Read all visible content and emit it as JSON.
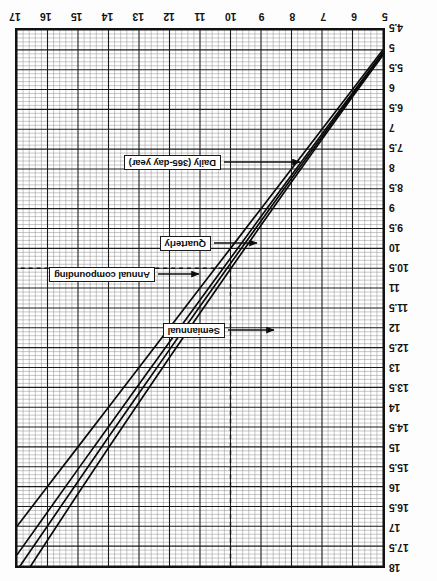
{
  "figure": {
    "orientation": "rotated-180",
    "background": "#ffffff",
    "ink": "#111111"
  },
  "chart_data": {
    "type": "line",
    "title": "",
    "subtitle": "",
    "xlabel": "",
    "ylabel": "",
    "grid": "log-log ruled graph paper, major and minor rulings",
    "legend_position": "inline callouts with leader arrows",
    "xlim": [
      5,
      17
    ],
    "ylim": [
      4.5,
      18
    ],
    "x_ticks": [
      5,
      6,
      7,
      8,
      9,
      10,
      11,
      12,
      13,
      14,
      15,
      16,
      17
    ],
    "x_ticklabels": [
      "5",
      "6",
      "7",
      "8",
      "9",
      "10",
      "11",
      "12",
      "13",
      "14",
      "15",
      "16",
      "17"
    ],
    "y_ticks": [
      4.5,
      5,
      5.5,
      6,
      6.5,
      7,
      7.5,
      8,
      8.5,
      9,
      9.5,
      10,
      10.5,
      11,
      11.5,
      12,
      12.5,
      13,
      13.5,
      14,
      14.5,
      15,
      15.5,
      16,
      16.5,
      17,
      17.5,
      18
    ],
    "y_ticklabels": [
      "4.5",
      "5",
      "5.5",
      "6",
      "6.5",
      "7",
      "7.5",
      "8",
      "8.5",
      "9",
      "9.5",
      "10",
      "10.5",
      "11",
      "11.5",
      "12",
      "12.5",
      "13",
      "13.5",
      "14",
      "14.5",
      "15",
      "15.5",
      "16",
      "16.5",
      "17",
      "17.5",
      "18"
    ],
    "annotations": [
      {
        "text": "10",
        "kind": "vertical-dashed-reference",
        "x": 10
      },
      {
        "text": "10.5",
        "kind": "horizontal-dashed-reference",
        "y": 10.5
      }
    ],
    "series": [
      {
        "name": "Annual compounding",
        "label": "Annual compounding",
        "x": [
          5,
          6,
          7,
          8,
          9,
          10,
          11,
          12,
          13,
          14,
          15,
          16,
          17
        ],
        "values": [
          5,
          6,
          7,
          8,
          9,
          10,
          11,
          12,
          13,
          14,
          15,
          16,
          17
        ]
      },
      {
        "name": "Semiannual",
        "label": "Semiannual",
        "x": [
          5,
          6,
          7,
          8,
          9,
          10,
          11,
          12,
          13,
          14,
          15,
          16,
          17
        ],
        "values": [
          5.06,
          6.09,
          7.12,
          8.16,
          9.2,
          10.25,
          11.3,
          12.36,
          13.42,
          14.49,
          15.56,
          16.64,
          17.72
        ]
      },
      {
        "name": "Quarterly",
        "label": "Quarterly",
        "x": [
          5,
          6,
          7,
          8,
          9,
          10,
          11,
          12,
          13,
          14,
          15,
          16,
          17
        ],
        "values": [
          5.09,
          6.14,
          7.19,
          8.24,
          9.31,
          10.38,
          11.46,
          12.55,
          13.65,
          14.75,
          15.87,
          16.99,
          18.11
        ]
      },
      {
        "name": "Daily (365-day year)",
        "label": "Daily (365-day year)",
        "x": [
          5,
          6,
          7,
          8,
          9,
          10,
          11,
          12,
          13,
          14,
          15,
          16,
          17
        ],
        "values": [
          5.13,
          6.18,
          7.25,
          8.33,
          9.42,
          10.52,
          11.63,
          12.75,
          13.88,
          15.02,
          16.18,
          17.35,
          18.53
        ]
      }
    ]
  },
  "callouts": {
    "semiannual": "Semiannual",
    "annual": "Annual compounding",
    "quarterly": "Quarterly",
    "daily": "Daily (365-day year)"
  }
}
